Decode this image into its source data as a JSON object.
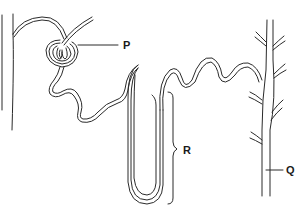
{
  "diagram": {
    "labels": {
      "P": "P",
      "Q": "Q",
      "R": "R"
    },
    "parts": [
      {
        "key": "P",
        "points_to": "glomerulus / Bowman's capsule"
      },
      {
        "key": "R",
        "points_to": "loop of Henle"
      },
      {
        "key": "Q",
        "points_to": "collecting duct"
      }
    ],
    "stroke_color": "#2a2a2a",
    "background": "#ffffff"
  }
}
